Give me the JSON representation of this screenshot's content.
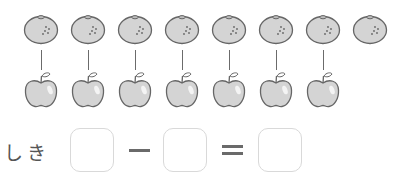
{
  "problem": {
    "top_row": {
      "fruit": "mandarin-orange",
      "count": 8
    },
    "bottom_row": {
      "fruit": "apple",
      "count": 7
    },
    "connector_lines": 7,
    "orange_x": [
      23,
      70,
      117,
      164,
      211,
      258,
      305,
      352
    ],
    "apple_x": [
      23,
      70,
      117,
      164,
      211,
      258,
      305
    ]
  },
  "equation": {
    "label": "しき",
    "operator_minus": "−",
    "operator_equals": "=",
    "boxes": [
      "",
      "",
      ""
    ]
  },
  "colors": {
    "fruit_fill": "#d4d4d4",
    "outline": "#666666",
    "box_border": "#d9d9d9",
    "text": "#555555"
  }
}
